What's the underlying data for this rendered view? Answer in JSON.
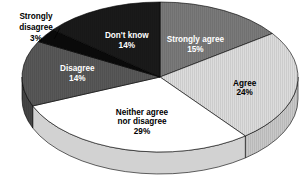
{
  "chart_data": {
    "type": "pie",
    "title": "",
    "subtitle": "",
    "xlabel": "",
    "ylabel": "",
    "legend_position": "none",
    "grid": false,
    "three_d": true,
    "start_angle_deg": 0,
    "direction": "clockwise",
    "categories": [
      "Strongly agree",
      "Agree",
      "Neither agree nor disagree",
      "Disagree",
      "Strongly disagree",
      "Don't know"
    ],
    "values": [
      15,
      24,
      29,
      14,
      3,
      14
    ],
    "value_unit": "%",
    "slices": [
      {
        "label": "Strongly agree",
        "label_line1": "Strongly agree",
        "label_line2": "",
        "value": 15,
        "value_text": "15%",
        "color": "#7a7a7a",
        "side_color": "#646464",
        "text_color": "#ffffff",
        "hatch": "vertical-fine",
        "label_placement": "inside"
      },
      {
        "label": "Agree",
        "label_line1": "Agree",
        "label_line2": "",
        "value": 24,
        "value_text": "24%",
        "color": "#dcdcdc",
        "side_color": "#c8c8c8",
        "text_color": "#000000",
        "hatch": "vertical-fine",
        "label_placement": "inside"
      },
      {
        "label": "Neither agree nor disagree",
        "label_line1": "Neither agree",
        "label_line2": "nor disagree",
        "value": 29,
        "value_text": "29%",
        "color": "#ffffff",
        "side_color": "#d2d2d2",
        "text_color": "#000000",
        "hatch": "none",
        "label_placement": "inside"
      },
      {
        "label": "Disagree",
        "label_line1": "Disagree",
        "label_line2": "",
        "value": 14,
        "value_text": "14%",
        "color": "#585858",
        "side_color": "#464646",
        "text_color": "#ffffff",
        "hatch": "vertical-fine",
        "label_placement": "inside"
      },
      {
        "label": "Strongly disagree",
        "label_line1": "Strongly",
        "label_line2": "disagree",
        "value": 3,
        "value_text": "3%",
        "color": "#0a0a0a",
        "side_color": "#000000",
        "text_color": "#000000",
        "hatch": "none",
        "label_placement": "callout"
      },
      {
        "label": "Don't know",
        "label_line1": "Don't know",
        "label_line2": "",
        "value": 14,
        "value_text": "14%",
        "color": "#1a1a1a",
        "side_color": "#0d0d0d",
        "text_color": "#ffffff",
        "hatch": "vertical-fine",
        "label_placement": "inside"
      }
    ]
  },
  "geometry": {
    "cx": 160,
    "cy": 77,
    "rx": 138,
    "ry": 75,
    "depth": 22
  },
  "callout": {
    "line1": "Strongly",
    "line2": "disagree",
    "line3": "3%",
    "x": 36,
    "y": 22
  }
}
